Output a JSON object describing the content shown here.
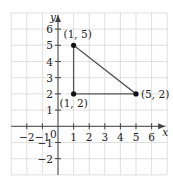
{
  "chart_data": {
    "type": "scatter",
    "title": "",
    "xlabel": "x",
    "ylabel": "y",
    "xlim": [
      -3,
      7
    ],
    "ylim": [
      -3,
      7
    ],
    "grid": true,
    "x_ticks": [
      -2,
      -1,
      1,
      2,
      3,
      4,
      5,
      6
    ],
    "y_ticks": [
      -2,
      -1,
      1,
      2,
      3,
      4,
      5,
      6
    ],
    "origin_label": "0",
    "series": [
      {
        "name": "triangle",
        "closed": true,
        "points": [
          {
            "x": 1,
            "y": 5,
            "label": "(1, 5)"
          },
          {
            "x": 5,
            "y": 2,
            "label": "(5, 2)"
          },
          {
            "x": 1,
            "y": 2,
            "label": "(1, 2)"
          }
        ]
      }
    ]
  },
  "colors": {
    "grid": "#d8d8d8",
    "axis": "#444444",
    "shape": "#555555",
    "point": "#111111"
  }
}
